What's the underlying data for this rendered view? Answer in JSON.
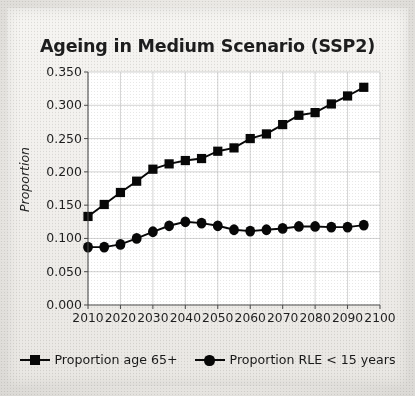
{
  "chart_data": {
    "type": "line",
    "title": "Ageing in Medium Scenario (SSP2)",
    "xlabel": "",
    "ylabel": "Proportion",
    "xlim": [
      2010,
      2100
    ],
    "ylim": [
      0.0,
      0.35
    ],
    "ytick_labels": [
      "0.350",
      "0.300",
      "0.250",
      "0.200",
      "0.150",
      "0.100",
      "0.050",
      "0.000"
    ],
    "ytick_values": [
      0.35,
      0.3,
      0.25,
      0.2,
      0.15,
      0.1,
      0.05,
      0.0
    ],
    "xtick_labels": [
      "2010",
      "2020",
      "2030",
      "2040",
      "2050",
      "2060",
      "2070",
      "2080",
      "2090",
      "2100"
    ],
    "xtick_values": [
      2010,
      2020,
      2030,
      2040,
      2050,
      2060,
      2070,
      2080,
      2090,
      2100
    ],
    "grid": true,
    "legend_position": "bottom",
    "x": [
      2010,
      2015,
      2020,
      2025,
      2030,
      2035,
      2040,
      2045,
      2050,
      2055,
      2060,
      2065,
      2070,
      2075,
      2080,
      2085,
      2090,
      2095
    ],
    "series": [
      {
        "name": "Proportion age 65+",
        "marker": "square",
        "color": "#080808",
        "values": [
          0.133,
          0.151,
          0.169,
          0.186,
          0.204,
          0.212,
          0.217,
          0.22,
          0.231,
          0.236,
          0.25,
          0.257,
          0.271,
          0.285,
          0.289,
          0.302,
          0.314,
          0.327
        ]
      },
      {
        "name": "Proportion RLE < 15 years",
        "marker": "circle",
        "color": "#080808",
        "values": [
          0.087,
          0.087,
          0.091,
          0.1,
          0.11,
          0.119,
          0.125,
          0.123,
          0.119,
          0.113,
          0.111,
          0.113,
          0.115,
          0.118,
          0.118,
          0.117,
          0.117,
          0.12
        ]
      }
    ]
  },
  "legend": {
    "items": [
      {
        "label": "Proportion age 65+"
      },
      {
        "label": "Proportion RLE < 15 years"
      }
    ]
  },
  "colors": {
    "ink": "#080808",
    "grid": "#c9c9c9",
    "axis": "#4a4a4a",
    "plot_bg": "#ffffff",
    "paper": "#f2f0ed"
  }
}
